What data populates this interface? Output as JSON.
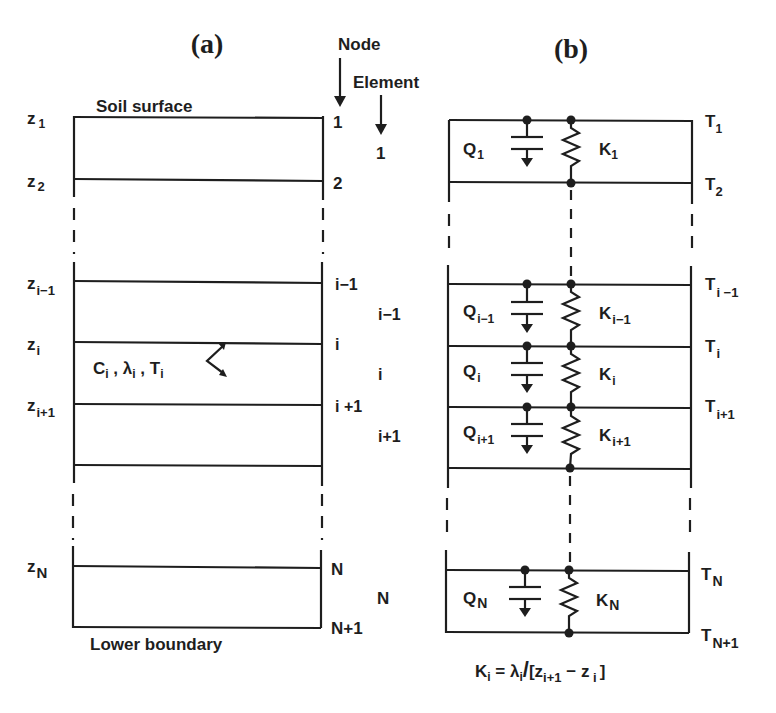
{
  "panel_a": {
    "title": "(a)",
    "node_header": "Node",
    "element_header": "Element",
    "top_label": "Soil surface",
    "bottom_label": "Lower boundary",
    "depth_labels": [
      {
        "base": "z",
        "sub": "1"
      },
      {
        "base": "z",
        "sub": "2"
      },
      {
        "base": "z",
        "sub": "i−1"
      },
      {
        "base": "z",
        "sub": "i"
      },
      {
        "base": "z",
        "sub": "i+1"
      },
      {
        "base": "z",
        "sub": "N"
      }
    ],
    "node_labels": [
      "1",
      "2",
      "i−1",
      "i",
      "i +1",
      "N",
      "N+1"
    ],
    "element_labels": [
      "1",
      "i−1",
      "i",
      "i+1",
      "N"
    ],
    "property_label": {
      "C": "C",
      "C_sub": "i",
      "lambda": "λ",
      "lambda_sub": "i",
      "T": "T",
      "T_sub": "i"
    }
  },
  "panel_b": {
    "title": "(b)",
    "temperature_labels": [
      {
        "base": "T",
        "sub": "1"
      },
      {
        "base": "T",
        "sub": "2"
      },
      {
        "base": "T",
        "sub": "i −1"
      },
      {
        "base": "T",
        "sub": "i"
      },
      {
        "base": "T",
        "sub": "i+1"
      },
      {
        "base": "T",
        "sub": "N"
      },
      {
        "base": "T",
        "sub": "N+1"
      }
    ],
    "capacitor_labels": [
      {
        "base": "Q",
        "sub": "1"
      },
      {
        "base": "Q",
        "sub": "i−1"
      },
      {
        "base": "Q",
        "sub": "i"
      },
      {
        "base": "Q",
        "sub": "i+1"
      },
      {
        "base": "Q",
        "sub": "N"
      }
    ],
    "resistor_labels": [
      {
        "base": "K",
        "sub": "1"
      },
      {
        "base": "K",
        "sub": "i−1"
      },
      {
        "base": "K",
        "sub": "i"
      },
      {
        "base": "K",
        "sub": "i+1"
      },
      {
        "base": "K",
        "sub": "N"
      }
    ],
    "equation": {
      "lhs": "K",
      "lhs_sub": "i",
      "eq": " = ",
      "lambda": "λ",
      "lambda_sub": "i",
      "slash": "/",
      "open": "[z",
      "z1_sub": "i+1",
      "minus": " − z",
      "z2_sub": " i",
      "close": "]"
    }
  }
}
